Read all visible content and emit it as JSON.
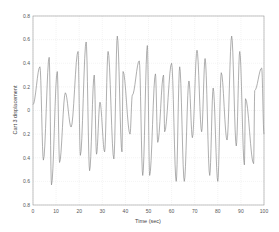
{
  "chart_data": {
    "type": "line",
    "title": "",
    "xlabel": "Time (sec)",
    "ylabel": "Cart 3 displacement",
    "xlim": [
      0,
      100
    ],
    "ylim": [
      -0.8,
      0.8
    ],
    "xticks": [
      0,
      10,
      20,
      30,
      40,
      50,
      60,
      70,
      80,
      90,
      100
    ],
    "xtick_labels": [
      "0",
      "10",
      "20",
      "30",
      "40",
      "50",
      "60",
      "70",
      "80",
      "90",
      "100"
    ],
    "yticks": [
      0.8,
      0.6,
      0.4,
      0.2,
      0,
      -0.2,
      -0.4,
      -0.6,
      -0.8
    ],
    "ytick_labels": [
      "0.8",
      "0.6",
      "0.4",
      "0.2",
      "0",
      "0.2",
      "0.4",
      "0.6",
      "0.8"
    ],
    "grid": true,
    "legend": null,
    "line_color": "#8c8c8c",
    "series": [
      {
        "name": "Cart 3 displacement",
        "x": [
          0,
          3,
          4.5,
          7,
          8,
          10.5,
          11.5,
          14,
          16.5,
          19.5,
          20.5,
          23,
          24.5,
          26.5,
          27.5,
          29,
          31,
          32.5,
          35,
          36.5,
          38.5,
          39,
          42,
          43,
          46,
          47.5,
          49.5,
          50.5,
          53,
          54,
          56.5,
          57,
          60,
          62,
          63.5,
          65.5,
          67.5,
          69,
          71,
          73,
          74.5,
          76.5,
          78,
          80,
          81.5,
          84,
          86,
          88,
          89.5,
          91.5,
          92,
          95.5,
          96,
          99,
          100
        ],
        "y": [
          0.05,
          0.37,
          -0.42,
          0.45,
          -0.63,
          0.33,
          -0.44,
          0.15,
          -0.14,
          0.5,
          -0.38,
          0.58,
          -0.51,
          0.3,
          -0.37,
          0.07,
          -0.35,
          0.5,
          -0.41,
          0.63,
          -0.35,
          0.33,
          -0.2,
          0.13,
          0.42,
          -0.55,
          0.55,
          -0.55,
          0.31,
          -0.27,
          0.3,
          -0.18,
          0.4,
          -0.6,
          0.37,
          -0.6,
          0.25,
          -0.23,
          0.51,
          -0.18,
          0.44,
          -0.55,
          0.19,
          -0.6,
          0.32,
          -0.25,
          0.63,
          -0.3,
          0.5,
          -0.46,
          0.1,
          -0.45,
          0.17,
          0.36,
          -0.2
        ]
      }
    ]
  }
}
